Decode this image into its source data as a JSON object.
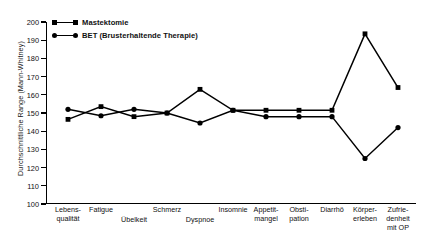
{
  "chart_data": {
    "type": "line",
    "title": "",
    "xlabel": "",
    "ylabel": "Durchschnittliche Range (Mann-Whitney)",
    "ylim": [
      100,
      200
    ],
    "ytick_step": 10,
    "yticks": [
      200,
      190,
      180,
      170,
      160,
      150,
      140,
      130,
      120,
      110,
      100
    ],
    "grid": false,
    "legend_position": "top-left",
    "categories": [
      "Lebens-qualität",
      "Fatigue",
      "Übelkeit",
      "Schmerz",
      "Dyspnoe",
      "Insomnie",
      "Appetit-mangel",
      "Obsti-pation",
      "Diarrhö",
      "Körper-erleben",
      "Zufriedenheit mit OP"
    ],
    "series": [
      {
        "name": "Mastektomie",
        "marker": "square",
        "color": "#000000",
        "values": [
          146.5,
          153.5,
          148.0,
          150.0,
          163.0,
          151.5,
          151.5,
          151.5,
          151.5,
          193.5,
          164.0
        ]
      },
      {
        "name": "BET (Brusterhaltende Therapie)",
        "marker": "circle",
        "color": "#000000",
        "values": [
          152.0,
          148.5,
          152.0,
          150.0,
          144.5,
          151.5,
          148.0,
          148.0,
          148.0,
          125.0,
          142.0
        ]
      }
    ]
  },
  "legend": {
    "entries": [
      {
        "label": "Mastektomie",
        "marker": "square-marker-icon"
      },
      {
        "label": "BET (Brusterhaltende Therapie)",
        "marker": "circle-marker-icon"
      }
    ]
  },
  "y_axis": {
    "title": "Durchschnittliche Range (Mann-Whitney)",
    "ticks": [
      "200",
      "190",
      "180",
      "170",
      "160",
      "150",
      "140",
      "130",
      "120",
      "110",
      "100"
    ]
  },
  "x_axis": {
    "labels": [
      {
        "line1": "Lebens-",
        "line2": "qualität",
        "stagger": "a"
      },
      {
        "line1": "Fatigue",
        "line2": "",
        "stagger": "a"
      },
      {
        "line1": "Übelkeit",
        "line2": "",
        "stagger": "b"
      },
      {
        "line1": "Schmerz",
        "line2": "",
        "stagger": "a"
      },
      {
        "line1": "Dyspnoe",
        "line2": "",
        "stagger": "b"
      },
      {
        "line1": "Insomnie",
        "line2": "",
        "stagger": "a"
      },
      {
        "line1": "Appetit-",
        "line2": "mangel",
        "stagger": "a"
      },
      {
        "line1": "Obsti-",
        "line2": "pation",
        "stagger": "a"
      },
      {
        "line1": "Diarrhö",
        "line2": "",
        "stagger": "a"
      },
      {
        "line1": "Körper-",
        "line2": "erleben",
        "stagger": "a"
      },
      {
        "line1": "Zufrie-",
        "line2": "denheit",
        "line3": "mit OP",
        "stagger": "a"
      }
    ]
  }
}
